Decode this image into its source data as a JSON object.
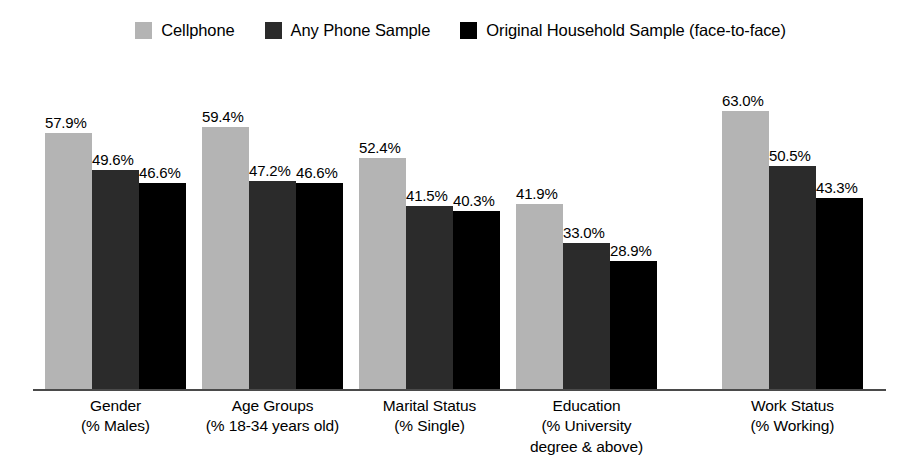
{
  "chart_data": {
    "type": "bar",
    "title": "",
    "xlabel": "",
    "ylabel": "",
    "ylim": [
      0,
      63
    ],
    "grid": false,
    "legend_position": "top-center",
    "value_suffix": "%",
    "categories": [
      "Gender\n(% Males)",
      "Age Groups\n(% 18-34 years old)",
      "Marital Status\n(% Single)",
      "Education\n(% University\ndegree & above)",
      "Work Status\n(% Working)"
    ],
    "series": [
      {
        "name": "Cellphone",
        "color": "#b4b4b4",
        "values": [
          57.9,
          59.4,
          52.4,
          41.9,
          63.0
        ],
        "labels": [
          "57.9%",
          "59.4%",
          "52.4%",
          "41.9%",
          "63.0%"
        ]
      },
      {
        "name": "Any Phone Sample",
        "color": "#2b2b2b",
        "values": [
          49.6,
          47.2,
          41.5,
          33.0,
          50.5
        ],
        "labels": [
          "49.6%",
          "47.2%",
          "41.5%",
          "33.0%",
          "50.5%"
        ]
      },
      {
        "name": "Original Household Sample (face-to-face)",
        "color": "#000000",
        "values": [
          46.6,
          46.6,
          40.3,
          28.9,
          43.3
        ],
        "labels": [
          "46.6%",
          "46.6%",
          "40.3%",
          "28.9%",
          "43.3%"
        ]
      }
    ]
  },
  "axis": {
    "line_color": "#4a4a4a"
  }
}
